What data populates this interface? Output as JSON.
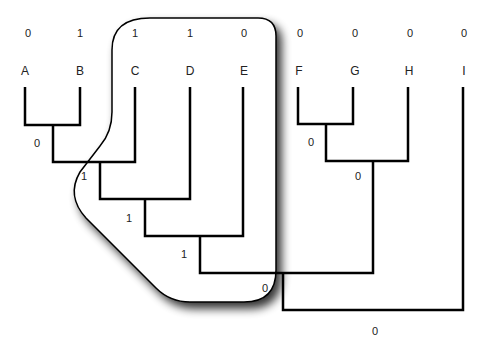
{
  "diagram": {
    "type": "phylogenetic-tree",
    "taxa": [
      {
        "name": "A",
        "state": "0",
        "x": 25
      },
      {
        "name": "B",
        "state": "1",
        "x": 80
      },
      {
        "name": "C",
        "state": "1",
        "x": 135
      },
      {
        "name": "D",
        "state": "1",
        "x": 190
      },
      {
        "name": "E",
        "state": "0",
        "x": 243
      },
      {
        "name": "F",
        "state": "0",
        "x": 298
      },
      {
        "name": "G",
        "state": "0",
        "x": 353
      },
      {
        "name": "H",
        "state": "0",
        "x": 408
      },
      {
        "name": "I",
        "state": "0",
        "x": 463
      }
    ],
    "internal_nodes": [
      {
        "id": "AB",
        "state": "0",
        "label_x": 37,
        "label_y": 147
      },
      {
        "id": "ABC",
        "state": "1",
        "label_x": 84,
        "label_y": 180
      },
      {
        "id": "ABCD",
        "state": "1",
        "label_x": 129,
        "label_y": 222
      },
      {
        "id": "ABCDE",
        "state": "1",
        "label_x": 184,
        "label_y": 257
      },
      {
        "id": "FG",
        "state": "0",
        "label_x": 311,
        "label_y": 146
      },
      {
        "id": "FGH",
        "state": "0",
        "label_x": 358,
        "label_y": 180
      },
      {
        "id": "ABCDEFGH",
        "state": "0",
        "label_x": 265,
        "label_y": 292
      },
      {
        "id": "root",
        "state": "0",
        "label_x": 375,
        "label_y": 334
      }
    ],
    "highlight": {
      "description": "clade C-D-E with ancestors",
      "stroke": "#000000"
    }
  }
}
